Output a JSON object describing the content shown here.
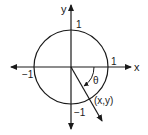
{
  "diagram": {
    "axes": {
      "x_label": "x",
      "y_label": "y"
    },
    "ticks": {
      "x_pos": "1",
      "x_neg": "−1",
      "y_pos": "1",
      "y_neg": "−1"
    },
    "angle_label": "θ",
    "point_label": "(x,y)",
    "circle_radius_units": 1,
    "angle_direction": "clockwise",
    "angle_degrees_approx": -60,
    "stroke_color": "#1a1a1a"
  }
}
